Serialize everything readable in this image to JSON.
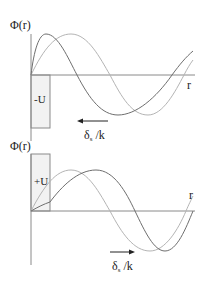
{
  "panels": [
    {
      "id": "attractive",
      "y_label": "Φ(r)",
      "x_label": "r",
      "potential_label": "-U",
      "shift_label_main": "δ",
      "shift_label_sub": "s",
      "shift_label_tail": " /k",
      "arrow_direction": "left"
    },
    {
      "id": "repulsive",
      "y_label": "Φ(r)",
      "x_label": "r",
      "potential_label": "+U",
      "shift_label_main": "δ",
      "shift_label_sub": "s",
      "shift_label_tail": " /k",
      "arrow_direction": "right"
    }
  ],
  "colors": {
    "axis": "#8a8a8a",
    "dark_curve": "#6e6e6e",
    "light_curve": "#b4b4b4",
    "box_fill": "#f2f2f2",
    "box_stroke": "#8a8a8a",
    "arrow": "#222222"
  }
}
